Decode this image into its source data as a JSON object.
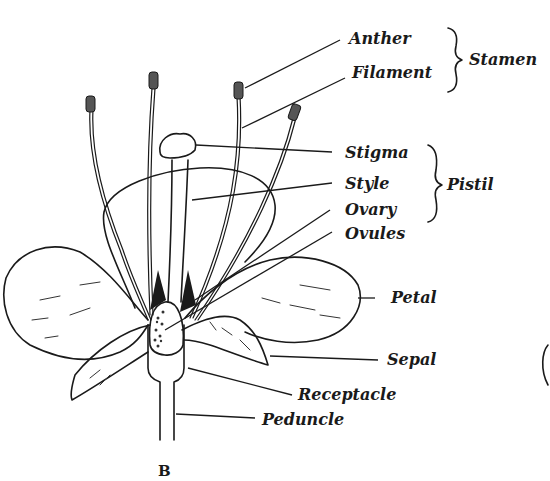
{
  "figure_label": "B",
  "labels": {
    "anther": "Anther",
    "filament": "Filament",
    "stamen": "Stamen",
    "stigma": "Stigma",
    "style": "Style",
    "ovary": "Ovary",
    "ovules": "Ovules",
    "pistil": "Pistil",
    "petal": "Petal",
    "sepal": "Sepal",
    "receptacle": "Receptacle",
    "peduncle": "Peduncle"
  },
  "groups": [
    {
      "name": "Stamen",
      "members": [
        "Anther",
        "Filament"
      ]
    },
    {
      "name": "Pistil",
      "members": [
        "Stigma",
        "Style",
        "Ovary"
      ]
    }
  ],
  "colors": {
    "ink": "#1a1a1a",
    "background": "#ffffff"
  }
}
